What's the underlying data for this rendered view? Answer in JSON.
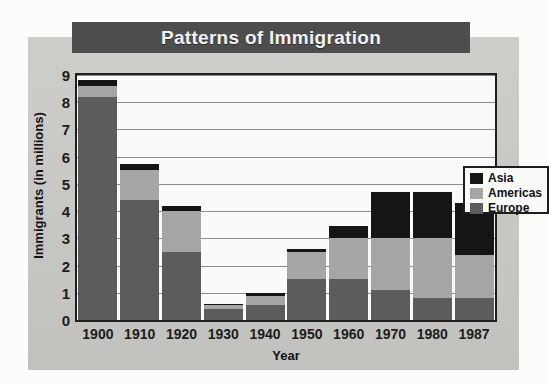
{
  "title": "Patterns of Immigration",
  "chart_data": {
    "type": "bar",
    "subtype": "stacked-bar",
    "title": "Patterns of Immigration",
    "xlabel": "Year",
    "ylabel": "Immigrants (in millions)",
    "categories": [
      "1900",
      "1910",
      "1920",
      "1930",
      "1940",
      "1950",
      "1960",
      "1970",
      "1980",
      "1987"
    ],
    "ylim": [
      0,
      9
    ],
    "yticks": [
      "0",
      "1",
      "2",
      "3",
      "4",
      "5",
      "6",
      "7",
      "8",
      "9"
    ],
    "grid": true,
    "grid_axis": "y",
    "legend_position": "top-right",
    "series": [
      {
        "name": "Europe",
        "color": "#5c5c5c",
        "values": [
          8.2,
          4.4,
          2.5,
          0.4,
          0.55,
          1.5,
          1.5,
          1.1,
          0.8,
          0.8
        ]
      },
      {
        "name": "Americas",
        "color": "#a6a6a6",
        "values": [
          0.4,
          1.1,
          1.5,
          0.15,
          0.35,
          1.0,
          1.5,
          1.9,
          2.2,
          1.6
        ]
      },
      {
        "name": "Asia",
        "color": "#141414",
        "values": [
          0.2,
          0.25,
          0.2,
          0.05,
          0.1,
          0.1,
          0.45,
          1.7,
          1.7,
          1.9
        ]
      }
    ],
    "totals": [
      8.8,
      5.75,
      4.2,
      0.6,
      1.0,
      2.6,
      3.45,
      4.7,
      4.7,
      4.3
    ]
  },
  "legend": {
    "items": [
      {
        "label": "Asia",
        "color": "#141414"
      },
      {
        "label": "Americas",
        "color": "#a6a6a6"
      },
      {
        "label": "Europe",
        "color": "#5c5c5c"
      }
    ]
  },
  "colors": {
    "title_bar": "#4d4d4d",
    "title_text": "#f3f3f1",
    "page_background": "#c9c9c5",
    "plot_background": "#fbfbf9",
    "axis": "#1d1d1d",
    "gridline": "#8e8e8e"
  }
}
